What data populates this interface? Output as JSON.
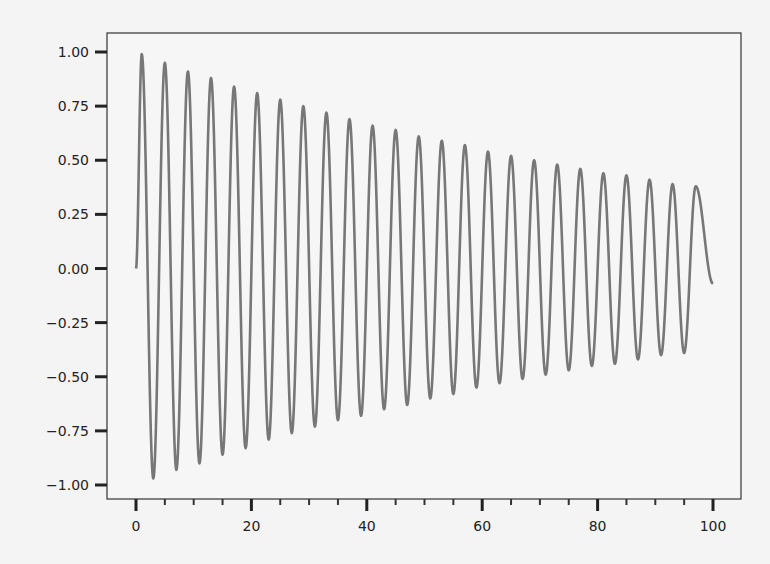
{
  "chart_data": {
    "type": "line",
    "title": "",
    "xlabel": "",
    "ylabel": "",
    "xlim": [
      -5,
      105
    ],
    "ylim": [
      -1.08,
      1.08
    ],
    "grid": false,
    "legend": null,
    "x_ticks": [
      0,
      20,
      40,
      60,
      80,
      100
    ],
    "x_tick_labels": [
      "0",
      "20",
      "40",
      "60",
      "80",
      "100"
    ],
    "x_minor_ticks": [
      5,
      10,
      15,
      25,
      30,
      35,
      45,
      50,
      55,
      65,
      70,
      75,
      85,
      90,
      95
    ],
    "y_ticks": [
      1.0,
      0.75,
      0.5,
      0.25,
      0.0,
      -0.25,
      -0.5,
      -0.75,
      -1.0
    ],
    "y_tick_labels": [
      "1.00",
      "0.75",
      "0.50",
      "0.25",
      "0.00",
      "−0.25",
      "−0.50",
      "−0.75",
      "−1.00"
    ],
    "series": [
      {
        "name": "damped sine",
        "color": "#777777",
        "function": "exp(-0.01*x)*sin(1.5708*x)",
        "x_range": [
          0,
          100
        ],
        "peaks": [
          {
            "x": 1,
            "y": 0.99
          },
          {
            "x": 5,
            "y": 0.95
          },
          {
            "x": 9,
            "y": 0.91
          },
          {
            "x": 13,
            "y": 0.88
          },
          {
            "x": 17,
            "y": 0.84
          },
          {
            "x": 21,
            "y": 0.81
          },
          {
            "x": 25,
            "y": 0.78
          },
          {
            "x": 29,
            "y": 0.75
          },
          {
            "x": 33,
            "y": 0.72
          },
          {
            "x": 37,
            "y": 0.69
          },
          {
            "x": 41,
            "y": 0.66
          },
          {
            "x": 45,
            "y": 0.64
          },
          {
            "x": 49,
            "y": 0.61
          },
          {
            "x": 53,
            "y": 0.59
          },
          {
            "x": 57,
            "y": 0.57
          },
          {
            "x": 61,
            "y": 0.54
          },
          {
            "x": 65,
            "y": 0.52
          },
          {
            "x": 69,
            "y": 0.5
          },
          {
            "x": 73,
            "y": 0.48
          },
          {
            "x": 77,
            "y": 0.46
          },
          {
            "x": 81,
            "y": 0.44
          },
          {
            "x": 85,
            "y": 0.43
          },
          {
            "x": 89,
            "y": 0.41
          },
          {
            "x": 93,
            "y": 0.39
          },
          {
            "x": 97,
            "y": 0.38
          }
        ],
        "troughs": [
          {
            "x": 3,
            "y": -0.97
          },
          {
            "x": 7,
            "y": -0.93
          },
          {
            "x": 11,
            "y": -0.9
          },
          {
            "x": 15,
            "y": -0.86
          },
          {
            "x": 19,
            "y": -0.83
          },
          {
            "x": 23,
            "y": -0.79
          },
          {
            "x": 27,
            "y": -0.76
          },
          {
            "x": 31,
            "y": -0.73
          },
          {
            "x": 35,
            "y": -0.7
          },
          {
            "x": 39,
            "y": -0.68
          },
          {
            "x": 43,
            "y": -0.65
          },
          {
            "x": 47,
            "y": -0.63
          },
          {
            "x": 51,
            "y": -0.6
          },
          {
            "x": 55,
            "y": -0.58
          },
          {
            "x": 59,
            "y": -0.55
          },
          {
            "x": 63,
            "y": -0.53
          },
          {
            "x": 67,
            "y": -0.51
          },
          {
            "x": 71,
            "y": -0.49
          },
          {
            "x": 75,
            "y": -0.47
          },
          {
            "x": 79,
            "y": -0.45
          },
          {
            "x": 83,
            "y": -0.44
          },
          {
            "x": 87,
            "y": -0.42
          },
          {
            "x": 91,
            "y": -0.4
          },
          {
            "x": 95,
            "y": -0.39
          }
        ],
        "start": {
          "x": 0,
          "y": 0.0
        },
        "end": {
          "x": 100,
          "y": -0.07
        }
      }
    ]
  },
  "layout": {
    "frame": {
      "left": 107,
      "top": 33,
      "right": 741,
      "bottom": 499
    },
    "x0_px": 136,
    "x100_px": 713,
    "y1_px": 52,
    "yneg1_px": 485
  }
}
